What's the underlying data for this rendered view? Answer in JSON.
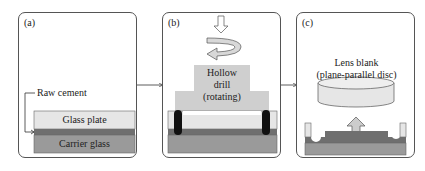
{
  "panels": [
    {
      "label": "(a)",
      "annotations": {
        "raw_cement": "Raw cement"
      },
      "layers": {
        "top": "Glass plate",
        "bottom": "Carrier glass"
      }
    },
    {
      "label": "(b)",
      "annotations": {
        "drill_line1": "Hollow",
        "drill_line2": "drill",
        "drill_line3": "(rotating)"
      }
    },
    {
      "label": "(c)",
      "annotations": {
        "lens_line1": "Lens blank",
        "lens_line2": "(plane-parallel disc)"
      }
    }
  ],
  "colors": {
    "glass_plate": "#e6e6e6",
    "cement": "#6f6f6f",
    "carrier": "#9a9a9a",
    "drill": "#cfcfcf",
    "drill_wall": "#111111",
    "arrow_fill": "#cccccc",
    "border": "#555555"
  }
}
